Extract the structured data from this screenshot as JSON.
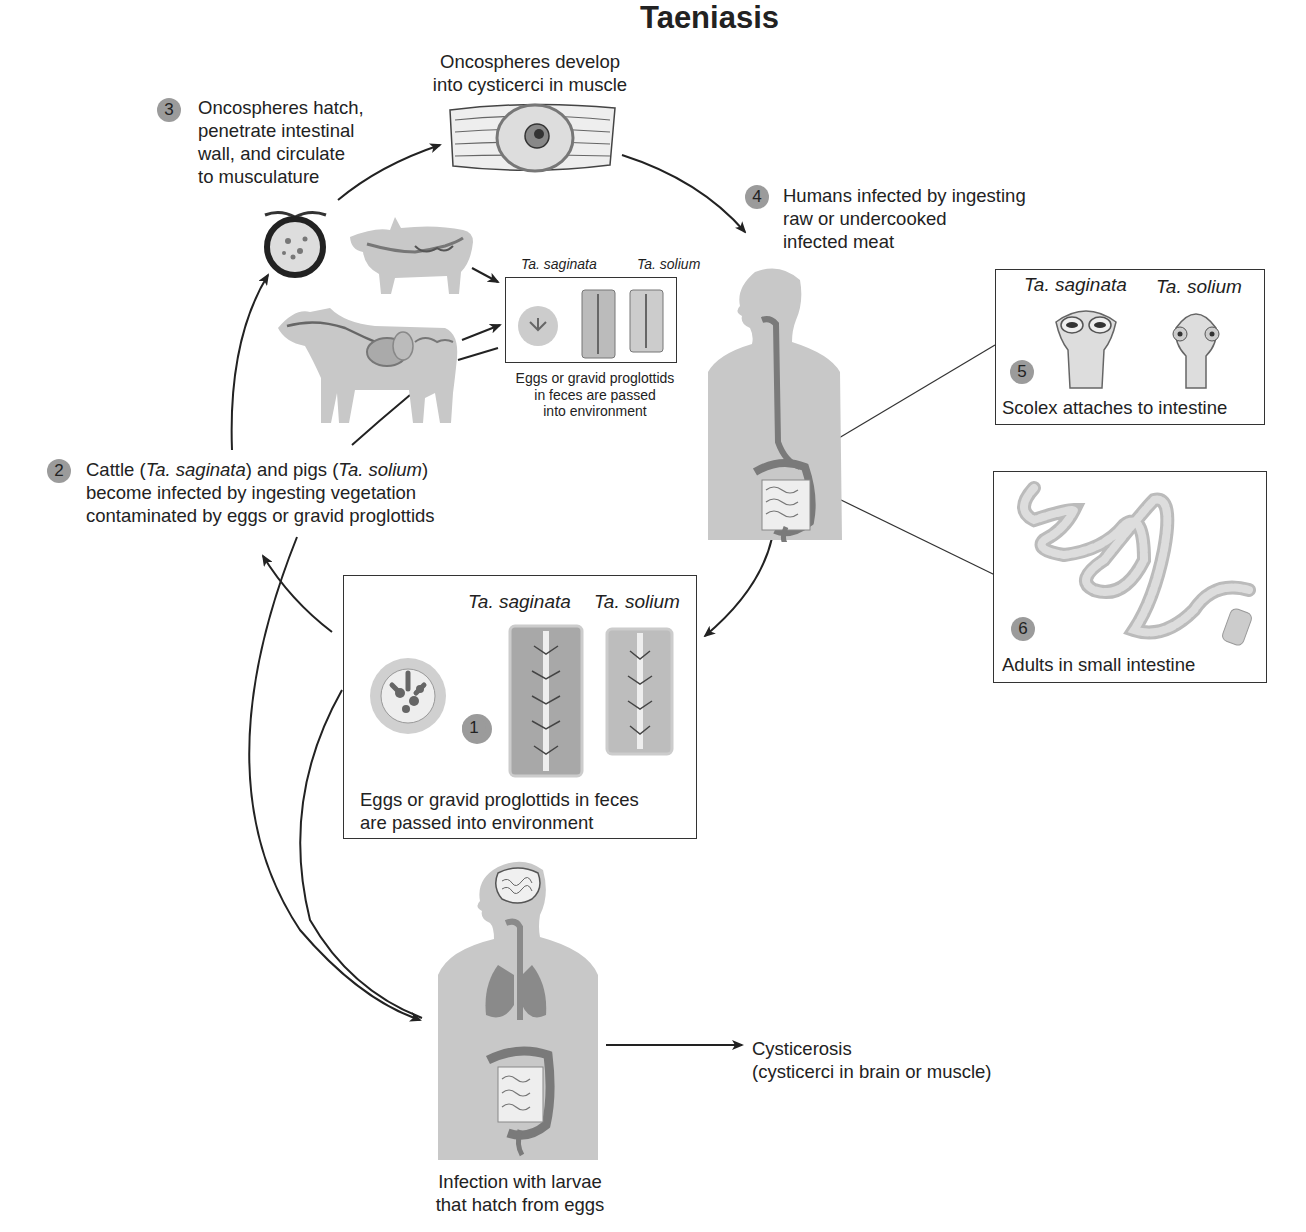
{
  "title": "Taeniasis",
  "steps": {
    "s1": {
      "number": "1",
      "caption_line1": "Eggs or gravid proglottids in feces",
      "caption_line2": "are passed into environment",
      "species": [
        "Ta. saginata",
        "Ta. solium"
      ]
    },
    "s2": {
      "number": "2",
      "line1_a": "Cattle (",
      "line1_b": "Ta. saginata",
      "line1_c": ") and pigs (",
      "line1_d": "Ta. solium",
      "line1_e": ")",
      "line2": "become infected by ingesting vegetation",
      "line3": "contaminated by eggs or gravid proglottids"
    },
    "s3": {
      "number": "3",
      "lines": [
        "Oncospheres hatch,",
        "penetrate intestinal",
        "wall, and circulate",
        "to musculature"
      ]
    },
    "s4": {
      "number": "4",
      "lines": [
        "Humans infected by ingesting",
        "raw or undercooked",
        "infected meat"
      ]
    },
    "s5": {
      "number": "5",
      "caption": "Scolex attaches to intestine",
      "species": [
        "Ta. saginata",
        "Ta. solium"
      ]
    },
    "s6": {
      "number": "6",
      "caption": "Adults in small intestine"
    }
  },
  "muscle_label": [
    "Oncospheres develop",
    "into cysticerci in muscle"
  ],
  "animal_box": {
    "species": [
      "Ta. saginata",
      "Ta. solium"
    ],
    "caption": [
      "Eggs or gravid proglottids",
      "in feces are passed",
      "into environment"
    ]
  },
  "larvae_label": [
    "Infection with larvae",
    "that hatch from eggs"
  ],
  "cysticerosis": {
    "title": "Cysticerosis",
    "detail": "(cysticerci in brain or muscle)"
  },
  "colors": {
    "step_badge": "#9b9b9b",
    "silhouette": "#c8c8c8",
    "organ": "#8a8a8a",
    "line": "#222222"
  }
}
